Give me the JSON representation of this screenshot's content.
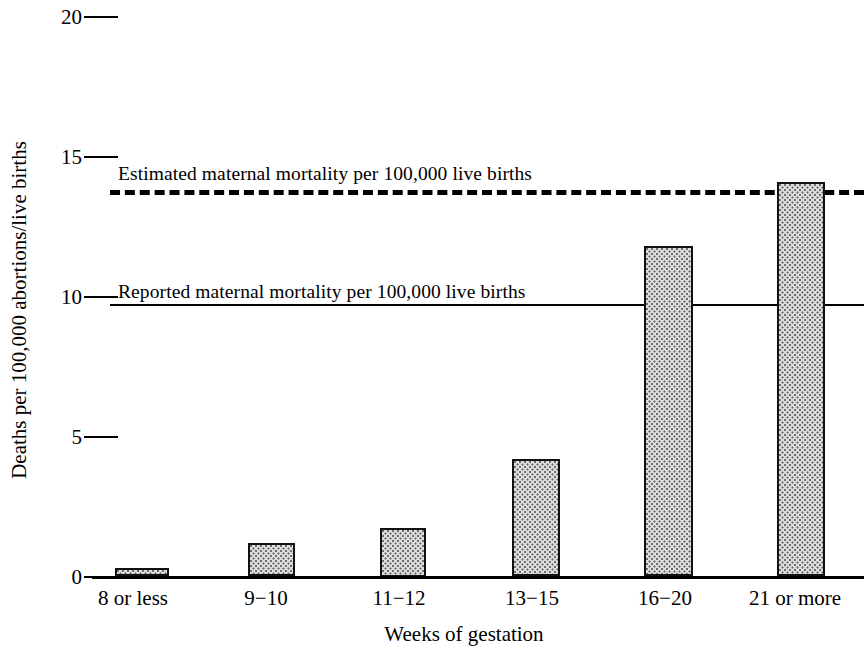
{
  "chart_data": {
    "type": "bar",
    "title": "",
    "xlabel": "Weeks of gestation",
    "ylabel": "Deaths per 100,000 abortions/live births",
    "categories": [
      "8 or less",
      "9−10",
      "11−12",
      "13−15",
      "16−20",
      "21 or more"
    ],
    "values": [
      0.3,
      1.2,
      1.75,
      4.2,
      11.8,
      14.1
    ],
    "ylim": [
      0,
      20
    ],
    "yticks": [
      0,
      5,
      10,
      15,
      20
    ],
    "ytick_labels": [
      "0",
      "5",
      "10",
      "15",
      "20"
    ],
    "grid": false,
    "legend_position": "inline-annotations",
    "annotations": [
      {
        "name": "estimated-maternal-mortality",
        "label": "Estimated maternal mortality per 100,000 live births",
        "value": 13.8,
        "style": "dashed"
      },
      {
        "name": "reported-maternal-mortality",
        "label": "Reported maternal mortality per 100,000 live births",
        "value": 9.75,
        "style": "solid"
      }
    ],
    "bar_fill": "#dedede",
    "bar_edge": "#111111",
    "axis_color": "#000000"
  }
}
